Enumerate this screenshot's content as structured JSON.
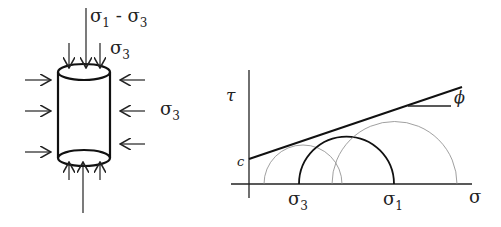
{
  "left_diagram": {
    "title": "Triaxial test specimen",
    "top_label": {
      "sigma1": "σ",
      "sub1": "1",
      "minus": " - σ",
      "sub3": "3"
    },
    "cap_label": {
      "sym": "σ",
      "sub": "3"
    },
    "side_label": {
      "sym": "σ",
      "sub": "3"
    }
  },
  "right_diagram": {
    "title": "Mohr-Coulomb failure envelope",
    "y_axis_label": "τ",
    "x_axis_label": "σ",
    "intercept_label": "c",
    "angle_label": "ϕ",
    "sigma3_label": {
      "sym": "σ",
      "sub": "3"
    },
    "sigma1_label": {
      "sym": "σ",
      "sub": "1"
    }
  }
}
